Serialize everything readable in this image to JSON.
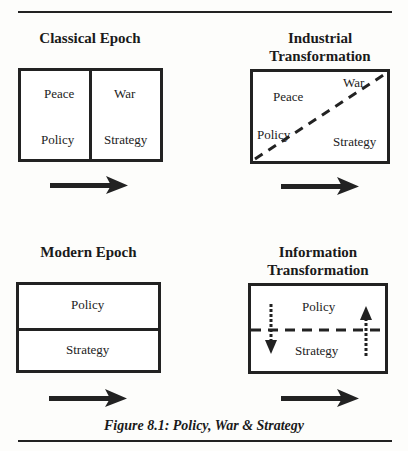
{
  "figure": {
    "caption": "Figure 8.1: Policy, War & Strategy",
    "panels": [
      {
        "title_lines": [
          "Classical Epoch"
        ],
        "labels": {
          "top_left": "Peace",
          "top_right": "War",
          "bottom_left": "Policy",
          "bottom_right": "Strategy"
        },
        "divider": "solid-vertical"
      },
      {
        "title_lines": [
          "Industrial",
          "Transformation"
        ],
        "labels": {
          "top_left": "Peace",
          "top_right": "War",
          "bottom_left": "Policy",
          "bottom_right": "Strategy"
        },
        "divider": "dashed-diagonal"
      },
      {
        "title_lines": [
          "Modern Epoch"
        ],
        "labels": {
          "top": "Policy",
          "bottom": "Strategy"
        },
        "divider": "solid-horizontal"
      },
      {
        "title_lines": [
          "Information",
          "Transformation"
        ],
        "labels": {
          "top": "Policy",
          "bottom": "Strategy"
        },
        "divider": "dashed-horizontal",
        "flows": [
          "down-arrow-dotted",
          "up-arrow-dotted"
        ]
      }
    ],
    "arrow_icon": "right-arrow-icon",
    "colors": {
      "ink": "#222222",
      "background": "#fdfdfb"
    }
  }
}
